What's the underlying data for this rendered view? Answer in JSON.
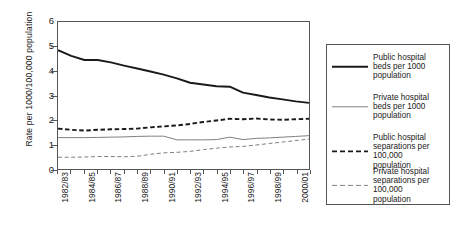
{
  "chart_data": {
    "type": "line",
    "title": "",
    "xlabel": "",
    "ylabel": "Rate per 1000/100,000 population",
    "ylim": [
      0,
      6
    ],
    "yticks": [
      0,
      1,
      2,
      3,
      4,
      5,
      6
    ],
    "grid": false,
    "legend_position": "right",
    "x": [
      "1982/83",
      "1983/84",
      "1984/85",
      "1985/86",
      "1986/87",
      "1987/88",
      "1988/89",
      "1989/90",
      "1990/91",
      "1991/92",
      "1992/93",
      "1993/94",
      "1994/95",
      "1995/96",
      "1996/97",
      "1997/98",
      "1998/99",
      "1999/00",
      "2000/01",
      "2001/02"
    ],
    "tick_labels": [
      "1982/83",
      "1984/85",
      "1986/87",
      "1988/89",
      "1990/91",
      "1992/93",
      "1994/95",
      "1996/97",
      "1998/99",
      "2000/01"
    ],
    "series": [
      {
        "name": "Public hospital beds per 1000 population",
        "style": "solid",
        "width": "thick",
        "color": "#1a1a1a",
        "values": [
          4.85,
          4.62,
          4.45,
          4.45,
          4.35,
          4.22,
          4.1,
          3.98,
          3.85,
          3.7,
          3.52,
          3.45,
          3.38,
          3.36,
          3.12,
          3.02,
          2.92,
          2.84,
          2.76,
          2.7
        ]
      },
      {
        "name": "Private hospital beds per 1000 population",
        "style": "solid",
        "width": "thin",
        "color": "#808080",
        "values": [
          1.28,
          1.28,
          1.28,
          1.29,
          1.3,
          1.31,
          1.33,
          1.34,
          1.34,
          1.19,
          1.19,
          1.19,
          1.2,
          1.3,
          1.2,
          1.25,
          1.27,
          1.3,
          1.33,
          1.36
        ]
      },
      {
        "name": "Public hospital separations per 100,000 population",
        "style": "dashed",
        "width": "thick",
        "color": "#1a1a1a",
        "values": [
          1.65,
          1.6,
          1.57,
          1.6,
          1.62,
          1.63,
          1.65,
          1.7,
          1.74,
          1.78,
          1.84,
          1.92,
          1.98,
          2.05,
          2.03,
          2.06,
          2.02,
          2.01,
          2.03,
          2.05
        ]
      },
      {
        "name": "Private hospital separations per 100,000 population",
        "style": "dashed",
        "width": "thin",
        "color": "#808080",
        "values": [
          0.48,
          0.48,
          0.49,
          0.51,
          0.51,
          0.5,
          0.52,
          0.6,
          0.66,
          0.68,
          0.72,
          0.79,
          0.85,
          0.9,
          0.92,
          0.98,
          1.04,
          1.1,
          1.16,
          1.22
        ]
      }
    ]
  },
  "axis": {
    "y_title": "Rate per 1000/100,000 population",
    "y_tick_labels": [
      "6",
      "5",
      "4",
      "3",
      "2",
      "1",
      "0"
    ],
    "x_tick_labels": [
      "1982/83",
      "1984/85",
      "1986/87",
      "1988/89",
      "1990/91",
      "1992/93",
      "1994/95",
      "1996/97",
      "1998/99",
      "2000/01"
    ]
  },
  "legend": {
    "items": [
      {
        "label": "Public hospital\nbeds per 1000\npopulation",
        "style": "solid-thick-black"
      },
      {
        "label": "Private hospital\nbeds per 1000\npopulation",
        "style": "solid-thin-gray"
      },
      {
        "label": "Public hospital\nseparations per\n100,000\npopulation",
        "style": "dashed-thick-black"
      },
      {
        "label": "Private hospital\nseparations per\n100,000\npopulation",
        "style": "dashed-thin-gray"
      }
    ]
  }
}
